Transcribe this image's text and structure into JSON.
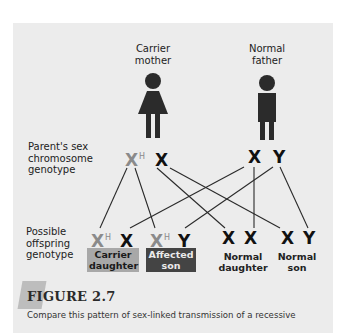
{
  "parents": {
    "mother": {
      "label_line1": "Carrier",
      "label_line2": "mother",
      "icon": "female-figure-icon"
    },
    "father": {
      "label_line1": "Normal",
      "label_line2": "father",
      "icon": "male-figure-icon"
    }
  },
  "row_labels": {
    "parent_genotype": {
      "line1": "Parent's sex",
      "line2": "chromosome",
      "line3": "genotype"
    },
    "offspring_genotype": {
      "line1": "Possible",
      "line2": "offspring",
      "line3": "genotype"
    }
  },
  "parent_genotypes": {
    "mother": {
      "allele1": "X",
      "allele1_sup": "H",
      "allele2": "X"
    },
    "father": {
      "allele1": "X",
      "allele2": "Y"
    }
  },
  "offspring": [
    {
      "allele1": "X",
      "allele1_sup": "H",
      "allele2": "X",
      "label_line1": "Carrier",
      "label_line2": "daughter",
      "style": "carrier"
    },
    {
      "allele1": "X",
      "allele1_sup": "H",
      "allele2": "Y",
      "label_line1": "Affected",
      "label_line2": "son",
      "style": "affected"
    },
    {
      "allele1": "X",
      "allele2": "X",
      "label_line1": "Normal",
      "label_line2": "daughter",
      "style": "normal"
    },
    {
      "allele1": "X",
      "allele2": "Y",
      "label_line1": "Normal",
      "label_line2": "son",
      "style": "normal"
    }
  ],
  "colors": {
    "panel_bg": "#ececec",
    "carrier_allele": "#8a8a8a",
    "carrier_box": "#a8a8a8",
    "affected_box": "#444444",
    "figure_icon": "#2b2b2b"
  },
  "figure": {
    "title": "FIGURE 2.7",
    "caption": "Compare this pattern of sex-linked transmission of a recessive"
  }
}
